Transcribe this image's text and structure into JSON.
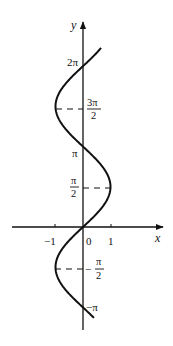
{
  "chart_data": {
    "type": "line",
    "title": "",
    "equation": "x = sin y",
    "xlabel": "x",
    "ylabel": "y",
    "xlim": [
      -2.6,
      2.9
    ],
    "ylim": [
      -4.0,
      7.5
    ],
    "grid": false,
    "legend": null,
    "x_ticks": [
      {
        "value": -1,
        "label": "−1"
      },
      {
        "value": 0,
        "label": "0"
      },
      {
        "value": 1,
        "label": "1"
      }
    ],
    "y_ticks": [
      {
        "value": 6.2832,
        "label": "2π"
      },
      {
        "value": 4.7124,
        "label_num": "3π",
        "label_den": "2",
        "dashed_to_x": -1
      },
      {
        "value": 3.1416,
        "label": "π"
      },
      {
        "value": 1.5708,
        "label_num": "π",
        "label_den": "2",
        "dashed_to_x": 1
      },
      {
        "value": -1.5708,
        "label_num": "−π",
        "label_den": "2",
        "dashed_to_x": -1
      },
      {
        "value": -3.1416,
        "label": "−π"
      }
    ],
    "series": [
      {
        "name": "x = sin y",
        "y_range": [
          -3.55,
          7.0
        ],
        "points": [
          {
            "y": -3.1416,
            "x": 0
          },
          {
            "y": -1.5708,
            "x": -1
          },
          {
            "y": 0,
            "x": 0
          },
          {
            "y": 1.5708,
            "x": 1
          },
          {
            "y": 3.1416,
            "x": 0
          },
          {
            "y": 4.7124,
            "x": -1
          },
          {
            "y": 6.2832,
            "x": 0
          }
        ]
      }
    ]
  },
  "axes": {
    "x_label": "x",
    "y_label": "y",
    "origin_label": "0",
    "x_neg_one": "−1",
    "x_pos_one": "1"
  },
  "labels": {
    "two_pi": "2π",
    "three_pi_num": "3π",
    "three_pi_den": "2",
    "pi": "π",
    "half_pi_num": "π",
    "half_pi_den": "2",
    "neg_half_pi_num": "π",
    "neg_half_pi_den": "2",
    "neg_half_pi_sign": "−",
    "neg_pi": "−π"
  }
}
